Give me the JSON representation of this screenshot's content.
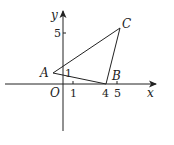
{
  "diagram": {
    "type": "coordinate-geometry",
    "axes": {
      "x_label": "x",
      "y_label": "y",
      "origin_label": "O"
    },
    "ticks": {
      "x": [
        "1",
        "4",
        "5"
      ],
      "y": [
        "5"
      ]
    },
    "points": [
      {
        "label": "A",
        "coords": [
          -1,
          1
        ]
      },
      {
        "label": "B",
        "coords": [
          4,
          0
        ]
      },
      {
        "label": "C",
        "coords": [
          5,
          5
        ]
      }
    ],
    "annotation": {
      "label": "1",
      "note": "angle mark at A"
    },
    "shape": "triangle ABC",
    "colors": {
      "stroke": "#222222",
      "background": "#ffffff"
    }
  }
}
